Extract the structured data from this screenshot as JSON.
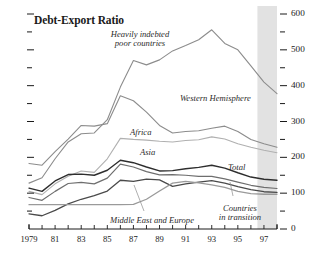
{
  "chart_data": {
    "type": "line",
    "title": "Debt-Export Ratio",
    "xlabel": "",
    "ylabel": "",
    "xlim": [
      1979,
      1998
    ],
    "ylim": [
      0,
      600
    ],
    "grid": false,
    "legend_position": "inline-annotations",
    "y_ticks_major": [
      0,
      100,
      200,
      300,
      400,
      500,
      600
    ],
    "y_ticks_minor": [
      50,
      150,
      250,
      350,
      450,
      550
    ],
    "y_tick_labels": [
      "0",
      "100",
      "200",
      "300",
      "400",
      "500",
      "600"
    ],
    "y_axis_side": "right",
    "x_ticks": [
      1979,
      1980,
      1981,
      1982,
      1983,
      1984,
      1985,
      1986,
      1987,
      1988,
      1989,
      1990,
      1991,
      1992,
      1993,
      1994,
      1995,
      1996,
      1997,
      1998
    ],
    "x_tick_labels": [
      "1979",
      "81",
      "83",
      "85",
      "87",
      "89",
      "91",
      "93",
      "95",
      "97"
    ],
    "x_tick_label_years": [
      1979,
      1981,
      1983,
      1985,
      1987,
      1989,
      1991,
      1993,
      1995,
      1997
    ],
    "shaded_region": {
      "from": 1996.5,
      "to": 1998,
      "label": "projection",
      "color": "#e2e2e2"
    },
    "x": [
      1979,
      1980,
      1981,
      1982,
      1983,
      1984,
      1985,
      1986,
      1987,
      1988,
      1989,
      1990,
      1991,
      1992,
      1993,
      1994,
      1995,
      1996,
      1997,
      1998
    ],
    "series": [
      {
        "name": "Heavily indebted poor countries",
        "color": "#8c8c8c",
        "width": 1.1,
        "values": [
          128,
          143,
          196,
          243,
          266,
          268,
          305,
          396,
          470,
          458,
          472,
          497,
          512,
          528,
          556,
          518,
          500,
          455,
          410,
          378
        ]
      },
      {
        "name": "Western Hemisphere",
        "color": "#8c8c8c",
        "width": 1.1,
        "values": [
          183,
          178,
          216,
          251,
          289,
          287,
          294,
          372,
          358,
          326,
          289,
          268,
          272,
          274,
          281,
          287,
          272,
          250,
          238,
          228
        ]
      },
      {
        "name": "Africa",
        "color": "#b0b0b0",
        "width": 1.1,
        "values": [
          105,
          96,
          126,
          147,
          162,
          158,
          196,
          253,
          250,
          248,
          245,
          243,
          247,
          249,
          257,
          251,
          238,
          228,
          220,
          213
        ]
      },
      {
        "name": "Asia",
        "color": "#6e6e6e",
        "width": 1.2,
        "values": [
          88,
          80,
          105,
          127,
          130,
          126,
          142,
          181,
          173,
          160,
          151,
          152,
          150,
          147,
          147,
          140,
          131,
          122,
          116,
          113
        ]
      },
      {
        "name": "Total",
        "color": "#2e2e2e",
        "width": 1.4,
        "values": [
          114,
          105,
          134,
          152,
          153,
          150,
          164,
          192,
          185,
          173,
          162,
          163,
          168,
          172,
          178,
          170,
          157,
          145,
          139,
          136
        ]
      },
      {
        "name": "Middle East and Europe",
        "color": "#4a4a4a",
        "width": 1.3,
        "values": [
          42,
          37,
          52,
          70,
          83,
          93,
          106,
          136,
          133,
          139,
          137,
          119,
          126,
          131,
          135,
          128,
          118,
          110,
          104,
          102
        ]
      },
      {
        "name": "Countries in transition",
        "color": "#9a9a9a",
        "width": 1.3,
        "values": [
          68,
          68,
          68,
          68,
          68,
          68,
          68,
          68,
          69,
          83,
          106,
          128,
          133,
          129,
          123,
          116,
          105,
          99,
          97,
          97
        ]
      }
    ],
    "annotations": [
      {
        "text_lines": [
          "Heavily indebted",
          "poor countries"
        ],
        "x_px": 140,
        "y_px": 30,
        "align": "center"
      },
      {
        "text_lines": [
          "Western Hemisphere"
        ],
        "x_px": 180,
        "y_px": 94,
        "align": "left"
      },
      {
        "text_lines": [
          "Africa"
        ],
        "x_px": 130,
        "y_px": 128,
        "align": "left"
      },
      {
        "text_lines": [
          "Asia"
        ],
        "x_px": 140,
        "y_px": 148,
        "align": "left"
      },
      {
        "text_lines": [
          "Total"
        ],
        "x_px": 228,
        "y_px": 163,
        "align": "left"
      },
      {
        "text_lines": [
          "Middle East and Europe"
        ],
        "x_px": 152,
        "y_px": 216,
        "align": "center"
      },
      {
        "text_lines": [
          "Countries",
          "in transition"
        ],
        "x_px": 240,
        "y_px": 204,
        "align": "center"
      }
    ],
    "leader_lines": [
      {
        "x1": 134,
        "y1": 185,
        "x2": 144,
        "y2": 211
      },
      {
        "x1": 230,
        "y1": 182,
        "x2": 233,
        "y2": 196
      }
    ]
  }
}
